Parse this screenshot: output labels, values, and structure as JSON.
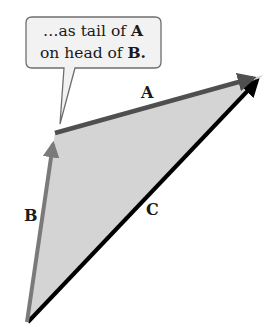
{
  "diagram": {
    "callout": {
      "line1_prefix": "…as tail of ",
      "line1_bold": "A",
      "line2_prefix": "on head of ",
      "line2_bold": "B.",
      "fill": "#f2f2f2",
      "stroke": "#6e6e6e"
    },
    "vectors": [
      {
        "name": "A",
        "label": "A",
        "from": [
          55,
          133
        ],
        "to": [
          263,
          75
        ],
        "color": "#5a5a5a"
      },
      {
        "name": "B",
        "label": "B",
        "from": [
          27,
          323
        ],
        "to": [
          55,
          133
        ],
        "color": "#7a7a7a"
      },
      {
        "name": "C",
        "label": "C",
        "from": [
          27,
          323
        ],
        "to": [
          263,
          75
        ],
        "color": "#000000"
      }
    ],
    "triangle_fill": "#d4d4d4",
    "labels": {
      "A": "A",
      "B": "B",
      "C": "C"
    }
  }
}
